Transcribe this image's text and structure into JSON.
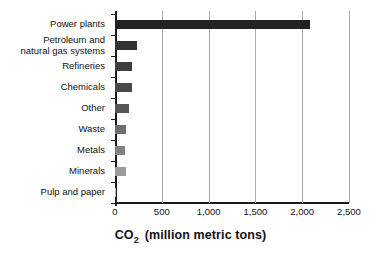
{
  "chart_data": {
    "type": "bar",
    "orientation": "horizontal",
    "title": "",
    "xlabel": "CO2  (million metric tons)",
    "xlabel_parts": {
      "prefix": "CO",
      "subscript": "2",
      "suffix": "(million metric tons)"
    },
    "ylabel": "",
    "xlim": [
      0,
      2500
    ],
    "xticks": [
      0,
      500,
      1000,
      1500,
      2000,
      2500
    ],
    "xtick_labels": [
      "0",
      "500",
      "1,000",
      "1,500",
      "2,000",
      "2,500"
    ],
    "grid": "vertical",
    "legend": "none",
    "categories": [
      "Power plants",
      "Petroleum and\nnatural gas systems",
      "Refineries",
      "Chemicals",
      "Other",
      "Waste",
      "Metals",
      "Minerals",
      "Pulp and paper"
    ],
    "values": [
      2080,
      235,
      180,
      180,
      150,
      115,
      110,
      115,
      10
    ],
    "bar_colors": [
      "#222222",
      "#333333",
      "#3d3d3d",
      "#4a4a4a",
      "#575757",
      "#6e6e6e",
      "#828282",
      "#9a9a9a",
      "#bdbdbd"
    ]
  },
  "axis": {
    "grid_color": "#a8a8a8",
    "line_color": "#1a1a1a"
  }
}
